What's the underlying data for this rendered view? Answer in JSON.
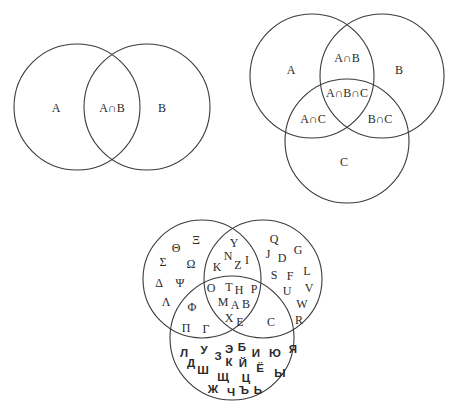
{
  "two_set_diagram": {
    "circles": [
      {
        "name": "A",
        "cx": 77,
        "cy": 107,
        "r": 63
      },
      {
        "name": "B",
        "cx": 147,
        "cy": 107,
        "r": 63
      }
    ],
    "labels": [
      {
        "text": "A",
        "x": 56,
        "y": 108
      },
      {
        "text": "A∩B",
        "x": 112,
        "y": 108
      },
      {
        "text": "B",
        "x": 162,
        "y": 108
      }
    ]
  },
  "three_set_diagram": {
    "circles": [
      {
        "name": "A",
        "cx": 312,
        "cy": 76,
        "r": 62
      },
      {
        "name": "B",
        "cx": 382,
        "cy": 76,
        "r": 62
      },
      {
        "name": "C",
        "cx": 347,
        "cy": 141,
        "r": 62
      }
    ],
    "labels": [
      {
        "text": "A",
        "x": 291,
        "y": 70
      },
      {
        "text": "A∩B",
        "x": 347,
        "y": 58
      },
      {
        "text": "B",
        "x": 399,
        "y": 70
      },
      {
        "text": "A∩B∩C",
        "x": 347,
        "y": 93
      },
      {
        "text": "A∩C",
        "x": 313,
        "y": 119
      },
      {
        "text": "B∩C",
        "x": 380,
        "y": 119
      },
      {
        "text": "C",
        "x": 344,
        "y": 162
      }
    ]
  },
  "alphabet_diagram": {
    "circles": [
      {
        "name": "greek",
        "cx": 202,
        "cy": 279,
        "r": 59
      },
      {
        "name": "latin",
        "cx": 263,
        "cy": 279,
        "r": 59
      },
      {
        "name": "cyrillic",
        "cx": 232,
        "cy": 338,
        "r": 62
      }
    ],
    "greek_only": [
      {
        "t": "Θ",
        "x": 176,
        "y": 248
      },
      {
        "t": "Ξ",
        "x": 196,
        "y": 240
      },
      {
        "t": "Σ",
        "x": 163,
        "y": 262
      },
      {
        "t": "Ω",
        "x": 191,
        "y": 264
      },
      {
        "t": "Δ",
        "x": 159,
        "y": 283
      },
      {
        "t": "Ψ",
        "x": 180,
        "y": 283
      },
      {
        "t": "Λ",
        "x": 166,
        "y": 302
      }
    ],
    "greek_latin": [
      {
        "t": "Y",
        "x": 234,
        "y": 243
      },
      {
        "t": "N",
        "x": 228,
        "y": 256
      },
      {
        "t": "I",
        "x": 247,
        "y": 260
      },
      {
        "t": "K",
        "x": 217,
        "y": 267
      },
      {
        "t": "Z",
        "x": 238,
        "y": 265
      }
    ],
    "greek_latin_cyrillic": [
      {
        "t": "O",
        "x": 211,
        "y": 288
      },
      {
        "t": "T",
        "x": 229,
        "y": 287
      },
      {
        "t": "H",
        "x": 239,
        "y": 290
      },
      {
        "t": "P",
        "x": 254,
        "y": 289
      },
      {
        "t": "M",
        "x": 223,
        "y": 302
      },
      {
        "t": "A",
        "x": 235,
        "y": 305
      },
      {
        "t": "B",
        "x": 246,
        "y": 304
      },
      {
        "t": "X",
        "x": 229,
        "y": 318
      },
      {
        "t": "E",
        "x": 240,
        "y": 322
      }
    ],
    "greek_cyrillic": [
      {
        "t": "Φ",
        "x": 192,
        "y": 307
      },
      {
        "t": "Π",
        "x": 186,
        "y": 328
      },
      {
        "t": "Γ",
        "x": 206,
        "y": 329
      }
    ],
    "latin_only": [
      {
        "t": "Q",
        "x": 274,
        "y": 239
      },
      {
        "t": "J",
        "x": 268,
        "y": 254
      },
      {
        "t": "D",
        "x": 282,
        "y": 258
      },
      {
        "t": "G",
        "x": 298,
        "y": 250
      },
      {
        "t": "L",
        "x": 307,
        "y": 271
      },
      {
        "t": "S",
        "x": 274,
        "y": 275
      },
      {
        "t": "F",
        "x": 290,
        "y": 276
      },
      {
        "t": "V",
        "x": 309,
        "y": 288
      },
      {
        "t": "U",
        "x": 287,
        "y": 291
      },
      {
        "t": "W",
        "x": 302,
        "y": 304
      },
      {
        "t": "R",
        "x": 299,
        "y": 320
      }
    ],
    "latin_cyrillic": [
      {
        "t": "C",
        "x": 271,
        "y": 322
      }
    ],
    "cyrillic_only": [
      {
        "t": "Л",
        "x": 184,
        "y": 353
      },
      {
        "t": "У",
        "x": 204,
        "y": 350
      },
      {
        "t": "Э",
        "x": 229,
        "y": 349
      },
      {
        "t": "Б",
        "x": 242,
        "y": 347
      },
      {
        "t": "И",
        "x": 256,
        "y": 353
      },
      {
        "t": "Ю",
        "x": 275,
        "y": 353
      },
      {
        "t": "Я",
        "x": 293,
        "y": 349
      },
      {
        "t": "Д",
        "x": 191,
        "y": 363
      },
      {
        "t": "З",
        "x": 218,
        "y": 356
      },
      {
        "t": "К",
        "x": 229,
        "y": 362
      },
      {
        "t": "Й",
        "x": 243,
        "y": 363
      },
      {
        "t": "Ё",
        "x": 260,
        "y": 368
      },
      {
        "t": "Ш",
        "x": 203,
        "y": 370
      },
      {
        "t": "Щ",
        "x": 223,
        "y": 377
      },
      {
        "t": "Ц",
        "x": 246,
        "y": 378
      },
      {
        "t": "Ы",
        "x": 280,
        "y": 373
      },
      {
        "t": "Ж",
        "x": 213,
        "y": 389
      },
      {
        "t": "Ч",
        "x": 231,
        "y": 392
      },
      {
        "t": "Ъ",
        "x": 244,
        "y": 390
      },
      {
        "t": "Ь",
        "x": 258,
        "y": 390
      }
    ]
  }
}
